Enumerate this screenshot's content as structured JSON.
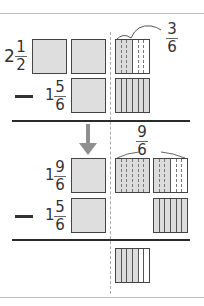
{
  "problem": {
    "step1": {
      "minuend": {
        "whole": "2",
        "numerator": "1",
        "denominator": "2"
      },
      "operator": "−",
      "subtrahend": {
        "whole": "1",
        "numerator": "5",
        "denominator": "6"
      },
      "callout": {
        "numerator": "3",
        "denominator": "6"
      }
    },
    "step2": {
      "minuend": {
        "whole": "1",
        "numerator": "9",
        "denominator": "6"
      },
      "operator": "−",
      "subtrahend": {
        "whole": "1",
        "numerator": "5",
        "denominator": "6"
      },
      "callout": {
        "numerator": "9",
        "denominator": "6"
      }
    },
    "result": {
      "shaded_sixths": 4,
      "total_sixths": 6
    }
  },
  "colors": {
    "shade": "#dcdcdc",
    "arrow": "#8f8f8f",
    "outline": "#444444",
    "rule": "#bdbdbd"
  }
}
